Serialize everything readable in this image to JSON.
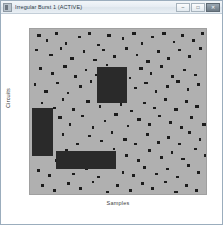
{
  "window": {
    "title": "Irregular Burst 1 (ACTIVE)",
    "icon": "app-icon",
    "controls": [
      {
        "name": "minimize",
        "glyph": "–"
      },
      {
        "name": "maximize",
        "glyph": "□"
      },
      {
        "name": "close",
        "glyph": "✕"
      }
    ]
  },
  "chart_data": {
    "type": "scatter",
    "title": "",
    "xlabel": "Samples",
    "ylabel": "Circuits",
    "grid": false,
    "legend": null,
    "xlim": [
      0,
      100
    ],
    "ylim": [
      0,
      100
    ],
    "background_color": "#b0b0b0",
    "mark_color": "#1c1c1c",
    "block_color": "#2a2a2a",
    "marks": [
      [
        4,
        3,
        2.0
      ],
      [
        9,
        6,
        1.4
      ],
      [
        14,
        2,
        1.8
      ],
      [
        20,
        8,
        1.2
      ],
      [
        27,
        4,
        2.2
      ],
      [
        33,
        2,
        1.4
      ],
      [
        38,
        9,
        1.6
      ],
      [
        44,
        3,
        1.8
      ],
      [
        52,
        5,
        1.2
      ],
      [
        58,
        2,
        2.0
      ],
      [
        63,
        8,
        1.4
      ],
      [
        69,
        4,
        1.6
      ],
      [
        75,
        2,
        2.2
      ],
      [
        81,
        7,
        1.3
      ],
      [
        86,
        3,
        1.7
      ],
      [
        92,
        6,
        1.5
      ],
      [
        97,
        2,
        1.9
      ],
      [
        3,
        12,
        1.6
      ],
      [
        11,
        15,
        2.1
      ],
      [
        17,
        11,
        1.3
      ],
      [
        23,
        17,
        1.8
      ],
      [
        30,
        13,
        1.5
      ],
      [
        36,
        18,
        2.0
      ],
      [
        41,
        12,
        1.4
      ],
      [
        47,
        16,
        1.7
      ],
      [
        54,
        11,
        1.9
      ],
      [
        60,
        15,
        1.3
      ],
      [
        66,
        19,
        2.2
      ],
      [
        72,
        13,
        1.6
      ],
      [
        78,
        17,
        1.4
      ],
      [
        84,
        12,
        1.8
      ],
      [
        90,
        16,
        1.5
      ],
      [
        96,
        11,
        2.0
      ],
      [
        5,
        23,
        1.7
      ],
      [
        12,
        26,
        1.4
      ],
      [
        19,
        22,
        2.1
      ],
      [
        25,
        28,
        1.6
      ],
      [
        31,
        24,
        1.3
      ],
      [
        37,
        27,
        1.9
      ],
      [
        43,
        21,
        1.5
      ],
      [
        50,
        25,
        1.8
      ],
      [
        56,
        29,
        1.4
      ],
      [
        62,
        23,
        2.0
      ],
      [
        68,
        26,
        1.6
      ],
      [
        74,
        22,
        1.3
      ],
      [
        80,
        28,
        1.7
      ],
      [
        87,
        24,
        1.5
      ],
      [
        93,
        27,
        1.9
      ],
      [
        2,
        33,
        1.5
      ],
      [
        8,
        37,
        2.0
      ],
      [
        15,
        32,
        1.6
      ],
      [
        21,
        38,
        1.3
      ],
      [
        28,
        34,
        1.8
      ],
      [
        34,
        31,
        1.4
      ],
      [
        40,
        36,
        1.7
      ],
      [
        46,
        33,
        2.1
      ],
      [
        53,
        39,
        1.5
      ],
      [
        59,
        35,
        1.6
      ],
      [
        65,
        32,
        1.9
      ],
      [
        71,
        37,
        1.3
      ],
      [
        77,
        34,
        1.7
      ],
      [
        83,
        31,
        2.0
      ],
      [
        89,
        36,
        1.4
      ],
      [
        95,
        33,
        1.8
      ],
      [
        6,
        44,
        1.6
      ],
      [
        13,
        47,
        1.9
      ],
      [
        18,
        42,
        1.4
      ],
      [
        24,
        48,
        1.7
      ],
      [
        32,
        43,
        2.0
      ],
      [
        39,
        46,
        1.3
      ],
      [
        45,
        41,
        1.8
      ],
      [
        51,
        45,
        1.5
      ],
      [
        57,
        49,
        1.6
      ],
      [
        64,
        44,
        2.1
      ],
      [
        70,
        47,
        1.4
      ],
      [
        76,
        42,
        1.7
      ],
      [
        82,
        48,
        1.9
      ],
      [
        88,
        43,
        1.5
      ],
      [
        94,
        46,
        1.8
      ],
      [
        3,
        54,
        1.8
      ],
      [
        10,
        58,
        1.5
      ],
      [
        16,
        53,
        2.0
      ],
      [
        22,
        57,
        1.4
      ],
      [
        29,
        52,
        1.7
      ],
      [
        35,
        59,
        1.6
      ],
      [
        42,
        55,
        1.3
      ],
      [
        48,
        51,
        1.9
      ],
      [
        55,
        58,
        1.5
      ],
      [
        61,
        54,
        1.8
      ],
      [
        67,
        57,
        2.0
      ],
      [
        73,
        52,
        1.4
      ],
      [
        79,
        56,
        1.6
      ],
      [
        85,
        59,
        1.7
      ],
      [
        91,
        53,
        1.5
      ],
      [
        98,
        57,
        1.9
      ],
      [
        5,
        65,
        1.4
      ],
      [
        11,
        68,
        1.8
      ],
      [
        18,
        63,
        1.6
      ],
      [
        26,
        69,
        2.0
      ],
      [
        33,
        64,
        1.5
      ],
      [
        40,
        67,
        1.7
      ],
      [
        46,
        62,
        1.3
      ],
      [
        53,
        66,
        1.9
      ],
      [
        59,
        69,
        1.6
      ],
      [
        66,
        63,
        1.4
      ],
      [
        72,
        68,
        1.8
      ],
      [
        78,
        65,
        1.5
      ],
      [
        84,
        69,
        2.0
      ],
      [
        90,
        62,
        1.7
      ],
      [
        96,
        66,
        1.4
      ],
      [
        7,
        75,
        1.9
      ],
      [
        14,
        79,
        1.5
      ],
      [
        20,
        73,
        1.7
      ],
      [
        27,
        77,
        1.4
      ],
      [
        34,
        74,
        2.0
      ],
      [
        41,
        78,
        1.6
      ],
      [
        47,
        72,
        1.3
      ],
      [
        54,
        76,
        1.8
      ],
      [
        61,
        79,
        1.5
      ],
      [
        67,
        73,
        1.9
      ],
      [
        74,
        77,
        1.6
      ],
      [
        80,
        74,
        1.4
      ],
      [
        86,
        78,
        1.8
      ],
      [
        93,
        72,
        1.7
      ],
      [
        99,
        76,
        1.5
      ],
      [
        4,
        85,
        1.6
      ],
      [
        10,
        88,
        1.9
      ],
      [
        17,
        83,
        1.4
      ],
      [
        24,
        87,
        1.7
      ],
      [
        31,
        84,
        2.0
      ],
      [
        38,
        89,
        1.5
      ],
      [
        45,
        82,
        1.8
      ],
      [
        52,
        86,
        1.3
      ],
      [
        58,
        88,
        1.6
      ],
      [
        64,
        83,
        1.9
      ],
      [
        71,
        87,
        1.5
      ],
      [
        77,
        84,
        1.7
      ],
      [
        83,
        89,
        1.4
      ],
      [
        89,
        82,
        1.8
      ],
      [
        95,
        86,
        1.6
      ],
      [
        6,
        94,
        1.7
      ],
      [
        13,
        97,
        1.5
      ],
      [
        21,
        93,
        1.9
      ],
      [
        28,
        96,
        1.4
      ],
      [
        35,
        92,
        1.6
      ],
      [
        43,
        98,
        1.8
      ],
      [
        49,
        94,
        1.5
      ],
      [
        56,
        97,
        1.7
      ],
      [
        63,
        93,
        2.0
      ],
      [
        69,
        96,
        1.4
      ],
      [
        76,
        92,
        1.6
      ],
      [
        82,
        98,
        1.9
      ],
      [
        88,
        94,
        1.5
      ],
      [
        94,
        97,
        1.7
      ]
    ],
    "blocks": [
      {
        "name": "block-left",
        "x": 1,
        "y": 48,
        "w": 12,
        "h": 29
      },
      {
        "name": "block-center",
        "x": 38,
        "y": 23,
        "w": 17,
        "h": 22
      },
      {
        "name": "block-bottom",
        "x": 15,
        "y": 74,
        "w": 34,
        "h": 11
      }
    ]
  }
}
